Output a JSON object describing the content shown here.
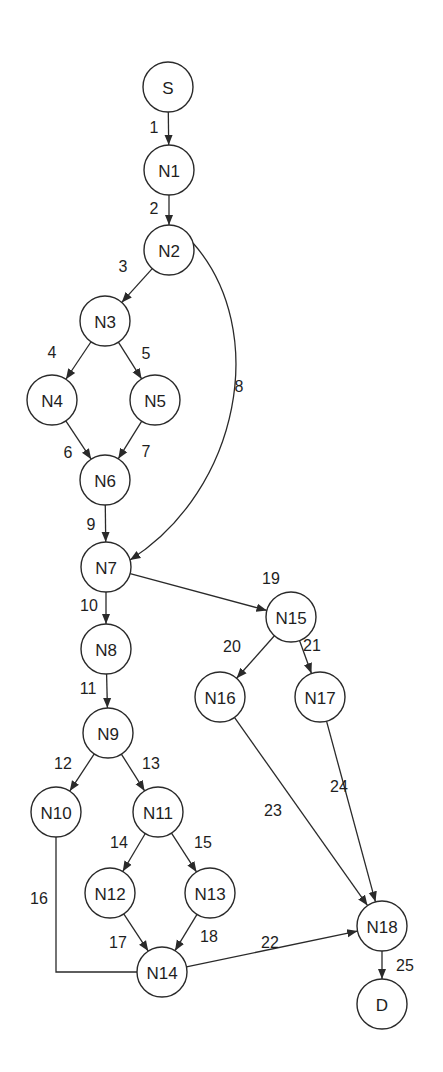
{
  "diagram": {
    "type": "control-flow-graph",
    "node_radius": 25,
    "colors": {
      "stroke": "#2a2a2a",
      "fill": "#ffffff",
      "text": "#1e1e1e",
      "background": "#ffffff"
    },
    "nodes": [
      {
        "id": "S",
        "label": "S",
        "x": 168,
        "y": 87
      },
      {
        "id": "N1",
        "label": "N1",
        "x": 169,
        "y": 170
      },
      {
        "id": "N2",
        "label": "N2",
        "x": 169,
        "y": 250
      },
      {
        "id": "N3",
        "label": "N3",
        "x": 105,
        "y": 321
      },
      {
        "id": "N4",
        "label": "N4",
        "x": 52,
        "y": 400
      },
      {
        "id": "N5",
        "label": "N5",
        "x": 155,
        "y": 400
      },
      {
        "id": "N6",
        "label": "N6",
        "x": 105,
        "y": 480
      },
      {
        "id": "N7",
        "label": "N7",
        "x": 106,
        "y": 567
      },
      {
        "id": "N8",
        "label": "N8",
        "x": 106,
        "y": 649
      },
      {
        "id": "N9",
        "label": "N9",
        "x": 108,
        "y": 733
      },
      {
        "id": "N10",
        "label": "N10",
        "x": 56,
        "y": 812
      },
      {
        "id": "N11",
        "label": "N11",
        "x": 158,
        "y": 812
      },
      {
        "id": "N12",
        "label": "N12",
        "x": 110,
        "y": 893
      },
      {
        "id": "N13",
        "label": "N13",
        "x": 210,
        "y": 893
      },
      {
        "id": "N14",
        "label": "N14",
        "x": 162,
        "y": 972
      },
      {
        "id": "N15",
        "label": "N15",
        "x": 291,
        "y": 617
      },
      {
        "id": "N16",
        "label": "N16",
        "x": 220,
        "y": 697
      },
      {
        "id": "N17",
        "label": "N17",
        "x": 320,
        "y": 697
      },
      {
        "id": "N18",
        "label": "N18",
        "x": 382,
        "y": 926
      },
      {
        "id": "D",
        "label": "D",
        "x": 382,
        "y": 1004
      }
    ],
    "edges": [
      {
        "label": "1",
        "from": "S",
        "to": "N1",
        "lx": 154,
        "ly": 127
      },
      {
        "label": "2",
        "from": "N1",
        "to": "N2",
        "lx": 154,
        "ly": 208
      },
      {
        "label": "3",
        "from": "N2",
        "to": "N3",
        "lx": 123,
        "ly": 266
      },
      {
        "label": "4",
        "from": "N3",
        "to": "N4",
        "lx": 52,
        "ly": 352
      },
      {
        "label": "5",
        "from": "N3",
        "to": "N5",
        "lx": 146,
        "ly": 353
      },
      {
        "label": "6",
        "from": "N4",
        "to": "N6",
        "lx": 68,
        "ly": 452
      },
      {
        "label": "7",
        "from": "N5",
        "to": "N6",
        "lx": 146,
        "ly": 451
      },
      {
        "label": "8",
        "from": "N2",
        "to": "N7",
        "lx": 239,
        "ly": 386,
        "curve": "M 193 243 C 270 330, 240 490, 130 560"
      },
      {
        "label": "9",
        "from": "N6",
        "to": "N7",
        "lx": 91,
        "ly": 524
      },
      {
        "label": "10",
        "from": "N7",
        "to": "N8",
        "lx": 89,
        "ly": 605
      },
      {
        "label": "11",
        "from": "N8",
        "to": "N9",
        "lx": 88,
        "ly": 688
      },
      {
        "label": "12",
        "from": "N9",
        "to": "N10",
        "lx": 63,
        "ly": 763
      },
      {
        "label": "13",
        "from": "N9",
        "to": "N11",
        "lx": 151,
        "ly": 763
      },
      {
        "label": "14",
        "from": "N11",
        "to": "N12",
        "lx": 119,
        "ly": 842
      },
      {
        "label": "15",
        "from": "N11",
        "to": "N13",
        "lx": 203,
        "ly": 842
      },
      {
        "label": "16",
        "from": "N10",
        "to": "N14",
        "lx": 39,
        "ly": 898,
        "curve": "M 56 837 L 56 972 L 137 972",
        "arrow": false
      },
      {
        "label": "17",
        "from": "N12",
        "to": "N14",
        "lx": 118,
        "ly": 942
      },
      {
        "label": "18",
        "from": "N13",
        "to": "N14",
        "lx": 209,
        "ly": 936
      },
      {
        "label": "19",
        "from": "N7",
        "to": "N15",
        "lx": 271,
        "ly": 578
      },
      {
        "label": "20",
        "from": "N15",
        "to": "N16",
        "lx": 232,
        "ly": 646
      },
      {
        "label": "21",
        "from": "N15",
        "to": "N17",
        "lx": 312,
        "ly": 645
      },
      {
        "label": "22",
        "from": "N14",
        "to": "N18",
        "lx": 270,
        "ly": 942
      },
      {
        "label": "23",
        "from": "N16",
        "to": "N18",
        "lx": 273,
        "ly": 810
      },
      {
        "label": "24",
        "from": "N17",
        "to": "N18",
        "lx": 339,
        "ly": 786
      },
      {
        "label": "25",
        "from": "N18",
        "to": "D",
        "lx": 405,
        "ly": 965
      }
    ]
  }
}
